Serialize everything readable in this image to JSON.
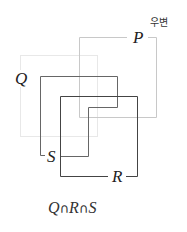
{
  "diagram": {
    "note": "우변",
    "labels": {
      "P": "P",
      "Q": "Q",
      "R": "R",
      "S": "S"
    },
    "formula": {
      "a": "Q",
      "op1": "∩",
      "b": "R",
      "op2": "∩",
      "c": "S"
    },
    "colors": {
      "set_P": "#c8c8c8",
      "set_faint": "#e6e6e6",
      "set_Q": "#555555",
      "set_R": "#444444",
      "set_S": "#555555"
    }
  }
}
